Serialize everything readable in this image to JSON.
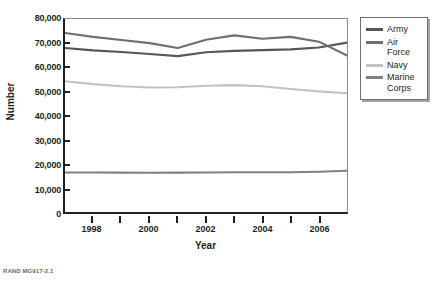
{
  "chart_data": {
    "type": "line",
    "title": "",
    "xlabel": "Year",
    "ylabel": "Number",
    "x": [
      1997,
      1998,
      1999,
      2000,
      2001,
      2002,
      2003,
      2004,
      2005,
      2006,
      2007
    ],
    "xlim": [
      1997,
      2007
    ],
    "ylim": [
      0,
      80000
    ],
    "y_ticks": [
      0,
      10000,
      20000,
      30000,
      40000,
      50000,
      60000,
      70000,
      80000
    ],
    "y_tick_labels": [
      "0",
      "10,000",
      "20,000",
      "30,000",
      "40,000",
      "50,000",
      "60,000",
      "70,000",
      "80,000"
    ],
    "x_ticks": [
      1997,
      1998,
      1999,
      2000,
      2001,
      2002,
      2003,
      2004,
      2005,
      2006,
      2007
    ],
    "x_tick_labels": [
      "",
      "1998",
      "",
      "2000",
      "",
      "2002",
      "",
      "2004",
      "",
      "2006",
      ""
    ],
    "grid": false,
    "legend_position": "right",
    "series": [
      {
        "name": "Army",
        "color": "#565656",
        "values": [
          68000,
          67000,
          66300,
          65500,
          64600,
          66200,
          66800,
          67100,
          67400,
          68200,
          70200
        ]
      },
      {
        "name": "Air Force",
        "color": "#6f6f6f",
        "values": [
          74200,
          72600,
          71300,
          70000,
          68000,
          71400,
          73200,
          71800,
          72600,
          70600,
          64900
        ]
      },
      {
        "name": "Navy",
        "color": "#c2c2c2",
        "values": [
          54200,
          53000,
          52100,
          51600,
          51700,
          52300,
          52600,
          52100,
          51000,
          50000,
          49200
        ]
      },
      {
        "name": "Marine Corps",
        "color": "#808080",
        "values": [
          16400,
          16350,
          16300,
          16250,
          16300,
          16400,
          16450,
          16450,
          16500,
          16700,
          17100
        ]
      }
    ]
  },
  "legend": {
    "items": [
      {
        "label_lines": [
          "Army"
        ],
        "color": "#565656"
      },
      {
        "label_lines": [
          "Air",
          "Force"
        ],
        "color": "#6f6f6f"
      },
      {
        "label_lines": [
          "Navy"
        ],
        "color": "#c2c2c2"
      },
      {
        "label_lines": [
          "Marine",
          "Corps"
        ],
        "color": "#808080"
      }
    ]
  },
  "footer": {
    "source_note": "RAND MG917-2.1"
  }
}
